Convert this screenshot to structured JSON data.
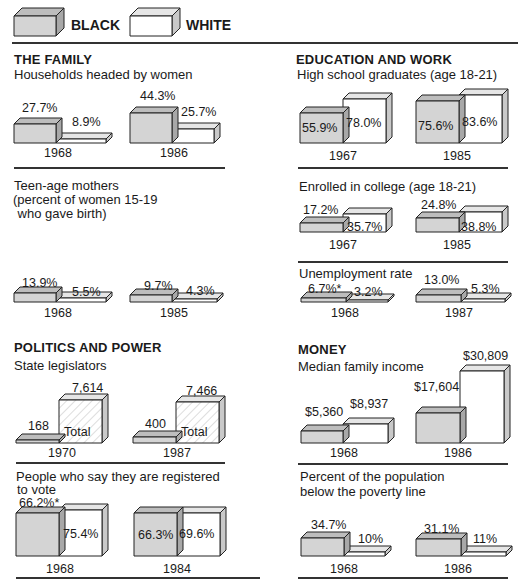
{
  "legend": {
    "black_label": "BLACK",
    "white_label": "WHITE",
    "colors": {
      "black_face": "#d4d4d4",
      "black_top": "#bdbdbd",
      "black_side": "#a8a8a8",
      "white_face": "#ffffff",
      "white_top": "#e6e6e6",
      "white_side": "#c9c9c9",
      "outline": "#222222"
    }
  },
  "sections": {
    "family": {
      "title": "THE FAMILY",
      "households": {
        "subtitle": "Households headed by women",
        "groups": [
          {
            "year": "1968",
            "black": "27.7%",
            "white": "8.9%"
          },
          {
            "year": "1986",
            "black": "44.3%",
            "white": "25.7%"
          }
        ]
      },
      "teen": {
        "subtitle_line1": "Teen-age mothers",
        "subtitle_line2": "(percent of women 15-19",
        "subtitle_line3": " who gave birth)",
        "groups": [
          {
            "year": "1968",
            "black": "13.9%",
            "white": "5.5%"
          },
          {
            "year": "1985",
            "black": "9.7%",
            "white": "4.3%"
          }
        ]
      }
    },
    "politics": {
      "title": "POLITICS AND POWER",
      "legislators": {
        "subtitle": "State legislators",
        "total_word": "Total",
        "groups": [
          {
            "year": "1970",
            "black": "168",
            "total": "7,614"
          },
          {
            "year": "1987",
            "black": "400",
            "total": "7,466"
          }
        ]
      },
      "voting": {
        "subtitle_line1": "People who say they are registered",
        "subtitle_line2": "to vote",
        "groups": [
          {
            "year": "1968",
            "black": "66.2%*",
            "white": "75.4%"
          },
          {
            "year": "1984",
            "black": "66.3%",
            "white": "69.6%"
          }
        ]
      }
    },
    "education": {
      "title": "EDUCATION AND WORK",
      "highschool": {
        "subtitle": "High school graduates (age 18-21)",
        "groups": [
          {
            "year": "1967",
            "black": "55.9%",
            "white": "78.0%"
          },
          {
            "year": "1985",
            "black": "75.6%",
            "white": "83.6%"
          }
        ]
      },
      "college": {
        "subtitle": "Enrolled in college (age 18-21)",
        "groups": [
          {
            "year": "1967",
            "black": "17.2%",
            "white": "35.7%"
          },
          {
            "year": "1985",
            "black": "24.8%",
            "white": "38.8%"
          }
        ]
      },
      "unemployment": {
        "subtitle": "Unemployment rate",
        "groups": [
          {
            "year": "1968",
            "black": "6.7%*",
            "white": "3.2%"
          },
          {
            "year": "1987",
            "black": "13.0%",
            "white": "5.3%"
          }
        ]
      }
    },
    "money": {
      "title": "MONEY",
      "income": {
        "subtitle": "Median family income",
        "groups": [
          {
            "year": "1968",
            "black": "$5,360",
            "white": "$8,937"
          },
          {
            "year": "1986",
            "black": "$17,604",
            "white": "$30,809"
          }
        ]
      },
      "poverty": {
        "subtitle_line1": "Percent of the population",
        "subtitle_line2": "below the poverty line",
        "groups": [
          {
            "year": "1968",
            "black": "34.7%",
            "white": "10%"
          },
          {
            "year": "1986",
            "black": "31.1%",
            "white": "11%"
          }
        ]
      }
    }
  },
  "chart_data": [
    {
      "type": "bar",
      "title": "Households headed by women",
      "section": "THE FAMILY",
      "unit": "%",
      "categories": [
        "1968",
        "1986"
      ],
      "series": [
        {
          "name": "BLACK",
          "values": [
            27.7,
            44.3
          ]
        },
        {
          "name": "WHITE",
          "values": [
            8.9,
            25.7
          ]
        }
      ]
    },
    {
      "type": "bar",
      "title": "Teen-age mothers (percent of women 15-19 who gave birth)",
      "section": "THE FAMILY",
      "unit": "%",
      "categories": [
        "1968",
        "1985"
      ],
      "series": [
        {
          "name": "BLACK",
          "values": [
            13.9,
            9.7
          ]
        },
        {
          "name": "WHITE",
          "values": [
            5.5,
            4.3
          ]
        }
      ]
    },
    {
      "type": "bar",
      "title": "State legislators",
      "section": "POLITICS AND POWER",
      "unit": "count",
      "categories": [
        "1970",
        "1987"
      ],
      "series": [
        {
          "name": "BLACK",
          "values": [
            168,
            400
          ]
        },
        {
          "name": "Total",
          "values": [
            7614,
            7466
          ]
        }
      ]
    },
    {
      "type": "bar",
      "title": "People who say they are registered to vote",
      "section": "POLITICS AND POWER",
      "unit": "%",
      "categories": [
        "1968",
        "1984"
      ],
      "series": [
        {
          "name": "BLACK",
          "values": [
            66.2,
            66.3
          ]
        },
        {
          "name": "WHITE",
          "values": [
            75.4,
            69.6
          ]
        }
      ],
      "annotations": [
        "* on 1968 black value"
      ]
    },
    {
      "type": "bar",
      "title": "High school graduates (age 18-21)",
      "section": "EDUCATION AND WORK",
      "unit": "%",
      "categories": [
        "1967",
        "1985"
      ],
      "series": [
        {
          "name": "BLACK",
          "values": [
            55.9,
            75.6
          ]
        },
        {
          "name": "WHITE",
          "values": [
            78.0,
            83.6
          ]
        }
      ]
    },
    {
      "type": "bar",
      "title": "Enrolled in college (age 18-21)",
      "section": "EDUCATION AND WORK",
      "unit": "%",
      "categories": [
        "1967",
        "1985"
      ],
      "series": [
        {
          "name": "BLACK",
          "values": [
            17.2,
            24.8
          ]
        },
        {
          "name": "WHITE",
          "values": [
            35.7,
            38.8
          ]
        }
      ]
    },
    {
      "type": "bar",
      "title": "Unemployment rate",
      "section": "EDUCATION AND WORK",
      "unit": "%",
      "categories": [
        "1968",
        "1987"
      ],
      "series": [
        {
          "name": "BLACK",
          "values": [
            6.7,
            13.0
          ]
        },
        {
          "name": "WHITE",
          "values": [
            3.2,
            5.3
          ]
        }
      ],
      "annotations": [
        "* on 1968 black value"
      ]
    },
    {
      "type": "bar",
      "title": "Median family income",
      "section": "MONEY",
      "unit": "$",
      "categories": [
        "1968",
        "1986"
      ],
      "series": [
        {
          "name": "BLACK",
          "values": [
            5360,
            17604
          ]
        },
        {
          "name": "WHITE",
          "values": [
            8937,
            30809
          ]
        }
      ]
    },
    {
      "type": "bar",
      "title": "Percent of the population below the poverty line",
      "section": "MONEY",
      "unit": "%",
      "categories": [
        "1968",
        "1986"
      ],
      "series": [
        {
          "name": "BLACK",
          "values": [
            34.7,
            31.1
          ]
        },
        {
          "name": "WHITE",
          "values": [
            10,
            11
          ]
        }
      ]
    }
  ]
}
